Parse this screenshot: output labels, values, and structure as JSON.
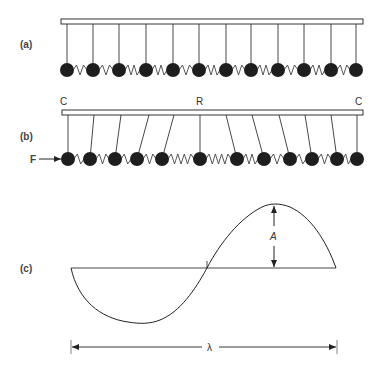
{
  "figure": {
    "panels": [
      {
        "id": "a",
        "label": "(a)"
      },
      {
        "id": "b",
        "label": "(b)",
        "left_marker": "C",
        "center_marker": "R",
        "right_marker": "C",
        "force_label": "F"
      },
      {
        "id": "c",
        "label": "(c)",
        "amplitude_label": "A",
        "wavelength_label": "λ"
      }
    ],
    "colors": {
      "ink": "#222222",
      "ball": "#1e1e1e",
      "background": "#ffffff"
    },
    "panel_a": {
      "ball_x": [
        67,
        93,
        119,
        146,
        173,
        199,
        226,
        251,
        278,
        304,
        331,
        356
      ],
      "rod_top_x": [
        67,
        93,
        119,
        146,
        173,
        199,
        226,
        251,
        278,
        304,
        331,
        356
      ]
    },
    "panel_b": {
      "ball_x": [
        68,
        90,
        115,
        137,
        162,
        200,
        237,
        264,
        290,
        312,
        337,
        357
      ],
      "rod_top_x": [
        68,
        94,
        121,
        149,
        174,
        200,
        226,
        252,
        279,
        305,
        331,
        357
      ]
    }
  }
}
